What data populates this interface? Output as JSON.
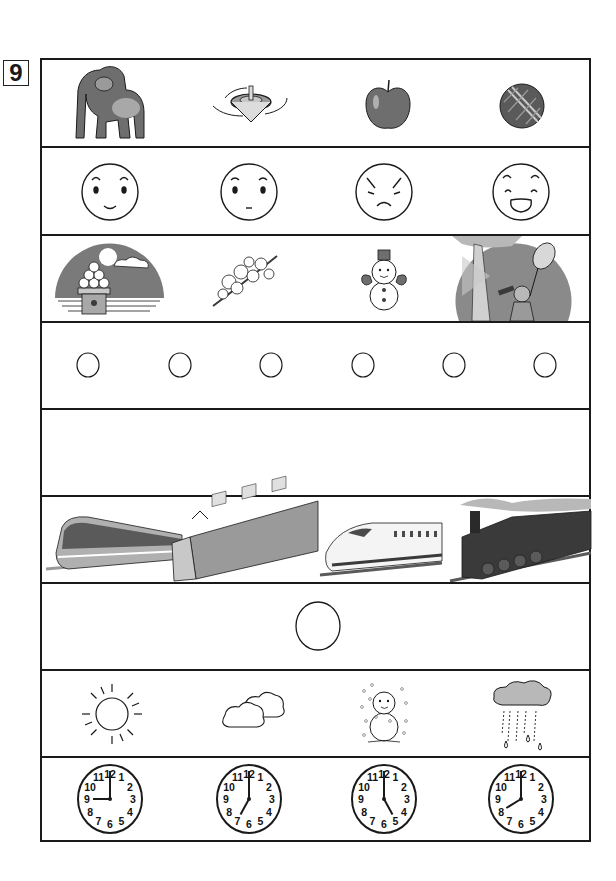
{
  "question": {
    "number": "9"
  },
  "colors": {
    "line": "#1a1a1a",
    "fill_dark": "#6e6e6e",
    "fill_mid": "#9a9a9a",
    "fill_light": "#c8c8c8",
    "background": "#ffffff"
  },
  "rows": [
    {
      "id": "row-1",
      "type": "pictures",
      "items": [
        "gorilla",
        "spinning-top",
        "apple",
        "temari-ball"
      ]
    },
    {
      "id": "row-2",
      "type": "faces",
      "items": [
        "happy-face",
        "neutral-face",
        "angry-face",
        "laughing-face"
      ]
    },
    {
      "id": "row-3",
      "type": "seasons",
      "items": [
        "moon-viewing-dango",
        "cherry-blossom",
        "snowman",
        "bug-catching-child"
      ]
    },
    {
      "id": "row-4",
      "type": "answer-circles",
      "count": 6
    },
    {
      "id": "row-5",
      "type": "blank"
    },
    {
      "id": "row-6",
      "type": "trains",
      "items": [
        "limited-express-train",
        "commuter-train",
        "shinkansen",
        "steam-locomotive"
      ]
    },
    {
      "id": "row-7",
      "type": "answer-circle",
      "count": 1
    },
    {
      "id": "row-8",
      "type": "weather",
      "items": [
        "sunny",
        "cloudy",
        "snowy",
        "rainy"
      ]
    },
    {
      "id": "row-9",
      "type": "clocks",
      "items": [
        {
          "label": "clock-9-oclock",
          "hour": 9,
          "minute": 0
        },
        {
          "label": "clock-7-oclock",
          "hour": 7,
          "minute": 0
        },
        {
          "label": "clock-5-oclock",
          "hour": 5,
          "minute": 0
        },
        {
          "label": "clock-8-oclock",
          "hour": 8,
          "minute": 0
        }
      ]
    }
  ],
  "clock_numbers": [
    "12",
    "1",
    "2",
    "3",
    "4",
    "5",
    "6",
    "7",
    "8",
    "9",
    "10",
    "11"
  ]
}
